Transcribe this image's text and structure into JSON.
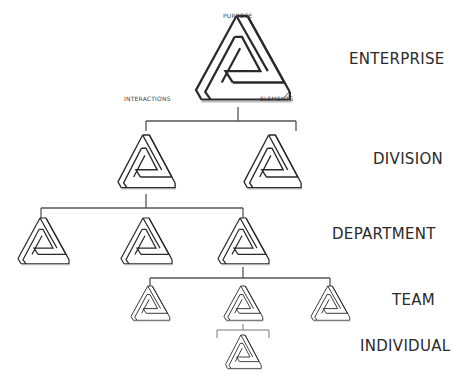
{
  "levels": [
    {
      "id": "enterprise",
      "label": "ENTERPRISE",
      "count": 1
    },
    {
      "id": "division",
      "label": "DIVISION",
      "count": 2
    },
    {
      "id": "department",
      "label": "DEPARTMENT",
      "count": 3
    },
    {
      "id": "team",
      "label": "TEAM",
      "count": 3
    },
    {
      "id": "individual",
      "label": "INDIVIDUAL",
      "count": 1
    }
  ],
  "enterprise_corners": {
    "top": "PURPOSE",
    "left": "INTERACTIONS",
    "right": "ELEMENTS"
  },
  "symbol": "penrose-triangle",
  "colors": {
    "stroke": "#2a2a2a",
    "shadow": "#bdbdbd",
    "background": "#ffffff"
  }
}
